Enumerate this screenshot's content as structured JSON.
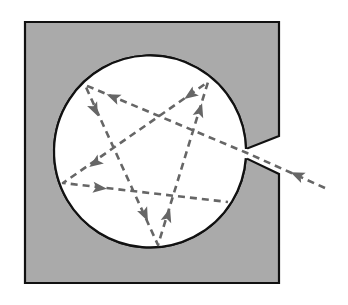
{
  "diagram": {
    "colors": {
      "background": "#ffffff",
      "block_fill": "#aaaaaa",
      "block_stroke": "#111111",
      "cavity_fill": "#ffffff",
      "ray": "#666666"
    },
    "block": {
      "x1": 25,
      "y1": 22,
      "x2": 279,
      "y2": 283
    },
    "notch": {
      "upper_edge": [
        [
          279,
          136
        ],
        [
          245,
          149
        ]
      ],
      "lower_edge": [
        [
          244,
          158
        ],
        [
          279,
          174
        ]
      ]
    },
    "cavity": {
      "cx": 150,
      "cy": 152,
      "r": 96
    },
    "ray_path": [
      [
        325,
        188
      ],
      [
        247,
        153
      ],
      [
        85,
        85
      ],
      [
        158,
        245
      ],
      [
        208,
        82
      ],
      [
        63,
        183
      ],
      [
        228,
        202
      ]
    ],
    "arrows": [
      {
        "at": [
          297,
          175
        ],
        "from": [
          325,
          188
        ],
        "to": [
          247,
          153
        ]
      },
      {
        "at": [
          113,
          97
        ],
        "from": [
          247,
          153
        ],
        "to": [
          85,
          85
        ]
      },
      {
        "at": [
          95,
          110
        ],
        "from": [
          85,
          85
        ],
        "to": [
          158,
          245
        ]
      },
      {
        "at": [
          145,
          215
        ],
        "from": [
          85,
          85
        ],
        "to": [
          158,
          245
        ]
      },
      {
        "at": [
          168,
          215
        ],
        "from": [
          158,
          245
        ],
        "to": [
          208,
          82
        ]
      },
      {
        "at": [
          200,
          110
        ],
        "from": [
          158,
          245
        ],
        "to": [
          208,
          82
        ]
      },
      {
        "at": [
          190,
          95
        ],
        "from": [
          208,
          82
        ],
        "to": [
          63,
          183
        ]
      },
      {
        "at": [
          95,
          163
        ],
        "from": [
          208,
          82
        ],
        "to": [
          63,
          183
        ]
      },
      {
        "at": [
          100,
          188
        ],
        "from": [
          63,
          183
        ],
        "to": [
          228,
          202
        ]
      }
    ]
  }
}
